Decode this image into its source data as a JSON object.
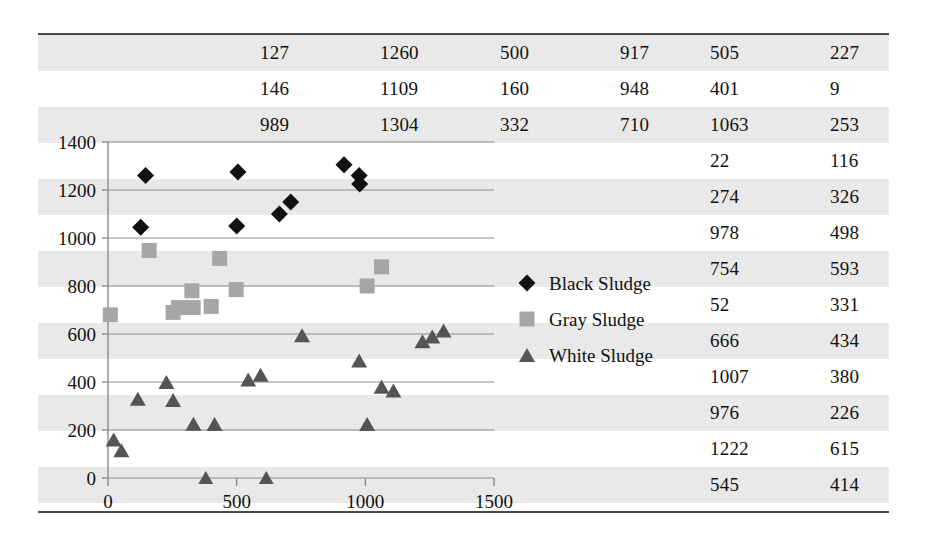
{
  "table": {
    "columns": 6,
    "rows": [
      [
        "127",
        "1260",
        "500",
        "917",
        "505",
        "227"
      ],
      [
        "146",
        "1109",
        "160",
        "948",
        "401",
        "9"
      ],
      [
        "989",
        "1304",
        "332",
        "710",
        "1063",
        "253"
      ],
      [
        "",
        "",
        "",
        "",
        "22",
        "116"
      ],
      [
        "",
        "",
        "",
        "",
        "274",
        "326"
      ],
      [
        "",
        "",
        "",
        "",
        "978",
        "498"
      ],
      [
        "",
        "",
        "",
        "",
        "754",
        "593"
      ],
      [
        "",
        "",
        "",
        "",
        "52",
        "331"
      ],
      [
        "",
        "",
        "",
        "",
        "666",
        "434"
      ],
      [
        "",
        "",
        "",
        "",
        "1007",
        "380"
      ],
      [
        "",
        "",
        "",
        "",
        "976",
        "226"
      ],
      [
        "",
        "",
        "",
        "",
        "1222",
        "615"
      ],
      [
        "",
        "",
        "",
        "",
        "545",
        "414"
      ]
    ]
  },
  "chart_data": {
    "type": "scatter",
    "title": "",
    "xlabel": "",
    "ylabel": "",
    "xlim": [
      0,
      1500
    ],
    "ylim": [
      0,
      1400
    ],
    "xticks": [
      "0",
      "500",
      "1000",
      "1500"
    ],
    "xtick_values": [
      0,
      500,
      1000,
      1500
    ],
    "yticks": [
      "0",
      "200",
      "400",
      "600",
      "800",
      "1000",
      "1200",
      "1400"
    ],
    "ytick_values": [
      0,
      200,
      400,
      600,
      800,
      1000,
      1200,
      1400
    ],
    "grid": "horizontal",
    "legend_position": "right-middle",
    "series": [
      {
        "name": "Black Sludge",
        "marker": "diamond",
        "color": "#111111",
        "points": [
          [
            127,
            1045
          ],
          [
            146,
            1260
          ],
          [
            500,
            1050
          ],
          [
            505,
            1275
          ],
          [
            666,
            1100
          ],
          [
            710,
            1150
          ],
          [
            917,
            1305
          ],
          [
            976,
            1260
          ],
          [
            978,
            1225
          ]
        ]
      },
      {
        "name": "Gray Sludge",
        "marker": "square",
        "color": "#a6a6a6",
        "points": [
          [
            9,
            680
          ],
          [
            160,
            948
          ],
          [
            253,
            690
          ],
          [
            274,
            710
          ],
          [
            326,
            780
          ],
          [
            331,
            710
          ],
          [
            401,
            715
          ],
          [
            434,
            915
          ],
          [
            498,
            785
          ],
          [
            1007,
            800
          ],
          [
            1063,
            880
          ]
        ]
      },
      {
        "name": "White Sludge",
        "marker": "triangle",
        "color": "#555555",
        "points": [
          [
            22,
            160
          ],
          [
            52,
            116
          ],
          [
            116,
            330
          ],
          [
            227,
            400
          ],
          [
            253,
            325
          ],
          [
            332,
            226
          ],
          [
            380,
            0
          ],
          [
            414,
            225
          ],
          [
            545,
            410
          ],
          [
            593,
            430
          ],
          [
            615,
            0
          ],
          [
            754,
            595
          ],
          [
            976,
            490
          ],
          [
            1007,
            225
          ],
          [
            1063,
            380
          ],
          [
            1109,
            365
          ],
          [
            1222,
            570
          ],
          [
            1260,
            590
          ],
          [
            1304,
            615
          ]
        ]
      }
    ]
  },
  "legend": {
    "items": [
      {
        "label": "Black Sludge",
        "marker": "diamond",
        "color": "#111111"
      },
      {
        "label": "Gray Sludge",
        "marker": "square",
        "color": "#a6a6a6"
      },
      {
        "label": "White Sludge",
        "marker": "triangle",
        "color": "#555555"
      }
    ]
  }
}
